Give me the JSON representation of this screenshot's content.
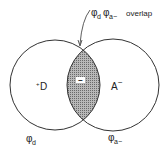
{
  "diagram": {
    "type": "venn",
    "title_annotation": {
      "phi1": "φ",
      "phi1_sub": "d",
      "phi2": "φ",
      "phi2_sub": "a−",
      "text": "overlap"
    },
    "left_circle": {
      "charge": "+",
      "label": "D",
      "wavefunction": "φ",
      "wavefunction_sub": "d"
    },
    "right_circle": {
      "label": "A",
      "charge": "−",
      "wavefunction": "φ",
      "wavefunction_sub": "a−"
    },
    "overlap_region": {
      "sign": "−",
      "fill_color": "#9a9a9a"
    },
    "colors": {
      "stroke": "#333333",
      "background": "#ffffff"
    }
  }
}
